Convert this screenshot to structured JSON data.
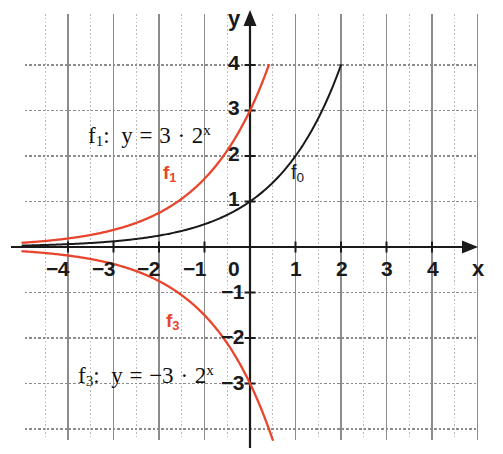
{
  "chart_data": {
    "type": "line",
    "title": "",
    "xlabel": "x",
    "ylabel": "y",
    "xlim": [
      -4.9,
      4.9
    ],
    "ylim": [
      -4.5,
      4.6
    ],
    "grid": true,
    "legend_position": "inline-annotations",
    "x_ticks": [
      "-4",
      "-3",
      "-2",
      "-1",
      "0",
      "1",
      "2",
      "3",
      "4"
    ],
    "x_tick_values": [
      -4,
      -3,
      -2,
      -1,
      0,
      1,
      2,
      3,
      4
    ],
    "y_ticks": [
      "4",
      "3",
      "2",
      "1",
      "-1",
      "-2",
      "-3"
    ],
    "y_tick_values": [
      4,
      3,
      2,
      1,
      -1,
      -2,
      -3
    ],
    "series": [
      {
        "name": "f0",
        "label": "f0",
        "expression": "y = 2^x",
        "color": "#1a1a1a",
        "x": [
          -5.0,
          -4.5,
          -4.0,
          -3.5,
          -3.0,
          -2.5,
          -2.0,
          -1.5,
          -1.0,
          -0.5,
          0.0,
          0.5,
          1.0,
          1.5,
          2.0
        ],
        "values": [
          0.031,
          0.044,
          0.063,
          0.088,
          0.125,
          0.177,
          0.25,
          0.354,
          0.5,
          0.707,
          1.0,
          1.414,
          2.0,
          2.828,
          4.0
        ]
      },
      {
        "name": "f1",
        "label": "f1",
        "expression": "y = 3 * 2^x",
        "color": "#e8452c",
        "x": [
          -5.0,
          -4.5,
          -4.0,
          -3.5,
          -3.0,
          -2.5,
          -2.0,
          -1.5,
          -1.0,
          -0.5,
          0.0,
          0.415
        ],
        "values": [
          0.094,
          0.133,
          0.188,
          0.265,
          0.375,
          0.53,
          0.75,
          1.061,
          1.5,
          2.121,
          3.0,
          4.0
        ]
      },
      {
        "name": "f3",
        "label": "f3",
        "expression": "y = -3 * 2^x",
        "color": "#e8452c",
        "x": [
          -5.0,
          -4.5,
          -4.0,
          -3.5,
          -3.0,
          -2.5,
          -2.0,
          -1.5,
          -1.0,
          -0.5,
          0.0,
          0.3,
          0.5
        ],
        "values": [
          -0.094,
          -0.133,
          -0.188,
          -0.265,
          -0.375,
          -0.53,
          -0.75,
          -1.061,
          -1.5,
          -2.121,
          -3.0,
          -3.69,
          -4.24
        ]
      }
    ],
    "annotations": [
      {
        "name": "formula-f1",
        "text": "f1:  y = 3 · 2^x",
        "x": -2.6,
        "y": 2.55
      },
      {
        "name": "formula-f3",
        "text": "f3:  y = −3 · 2^x",
        "x": -2.85,
        "y": -2.55
      },
      {
        "name": "curve-label-f1",
        "text": "f1",
        "x": -2.0,
        "y": 1.78
      },
      {
        "name": "curve-label-f0",
        "text": "f0",
        "x": 0.82,
        "y": 1.78
      },
      {
        "name": "curve-label-f3",
        "text": "f3",
        "x": -1.95,
        "y": -1.5
      }
    ]
  },
  "axes": {
    "x_name": "x",
    "y_name": "y",
    "x_tick_labels": [
      {
        "text": "−4",
        "value": -4
      },
      {
        "text": "−3",
        "value": -3
      },
      {
        "text": "−2",
        "value": -2
      },
      {
        "text": "−1",
        "value": -1
      },
      {
        "text": "0",
        "value": 0
      },
      {
        "text": "1",
        "value": 1
      },
      {
        "text": "2",
        "value": 2
      },
      {
        "text": "3",
        "value": 3
      },
      {
        "text": "4",
        "value": 4
      }
    ],
    "y_tick_labels": [
      {
        "text": "4",
        "value": 4
      },
      {
        "text": "3",
        "value": 3
      },
      {
        "text": "2",
        "value": 2
      },
      {
        "text": "1",
        "value": 1
      },
      {
        "text": "−1",
        "value": -1
      },
      {
        "text": "−2",
        "value": -2
      },
      {
        "text": "−3",
        "value": -3
      }
    ]
  },
  "formulas": {
    "f1": {
      "fname": "f",
      "fsub": "1",
      "colon": ":",
      "body_lhs": "y",
      "equals": "=",
      "coefficient": "3",
      "dot": "·",
      "base": "2",
      "exponent": "x"
    },
    "f3": {
      "fname": "f",
      "fsub": "3",
      "colon": ":",
      "body_lhs": "y",
      "equals": "=",
      "coefficient": "−3",
      "dot": "·",
      "base": "2",
      "exponent": "x"
    }
  },
  "curve_labels": {
    "f1": {
      "name": "f",
      "sub": "1"
    },
    "f0": {
      "name": "f",
      "sub": "0"
    },
    "f3": {
      "name": "f",
      "sub": "3"
    }
  },
  "colors": {
    "curve_red": "#e8452c",
    "curve_black": "#1a1a1a",
    "axis": "#1a1a1a",
    "grid_major": "#8c8c8c",
    "grid_minor": "#b8b8b8",
    "background": "#ffffff"
  }
}
